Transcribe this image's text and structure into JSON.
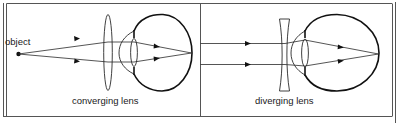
{
  "figure": {
    "panels": [
      {
        "id": "converging",
        "caption": "converging lens",
        "object_label": "object",
        "lens_type": "converging",
        "incoming_rays": "diverging from point object",
        "ray_count": 2
      },
      {
        "id": "diverging",
        "caption": "diverging lens",
        "lens_type": "diverging",
        "incoming_rays": "parallel",
        "ray_count": 2
      }
    ],
    "colors": {
      "line": "#111111",
      "frame": "#555555",
      "background": "#ffffff"
    }
  }
}
